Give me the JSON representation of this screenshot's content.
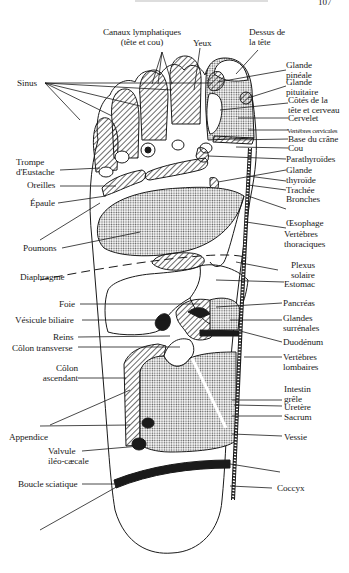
{
  "page": {
    "page_number": "107"
  },
  "diagram": {
    "colors": {
      "ink": "#1a1a1a",
      "paper": "#ffffff",
      "stipple": "#bdbdbd"
    },
    "labels_left": {
      "sinus": "Sinus",
      "trompe": "Trompe\nd'Eustache",
      "oreilles": "Oreilles",
      "epaule": "Épaule",
      "poumons": "Poumons",
      "diaphragme": "Diaphragme",
      "foie": "Foie",
      "vesicule": "Vésicule biliaire",
      "reins": "Reins",
      "colon_transverse": "Côlon transverse",
      "colon_ascendant": "Côlon\nascendant",
      "appendice": "Appendice",
      "valvule": "Valvule\niléo-cæcale",
      "boucle": "Boucle sciatique"
    },
    "labels_top": {
      "canaux": "Canaux lymphatiques\n(tête et cou)",
      "yeux": "Yeux",
      "dessus": "Dessus de\nla tête"
    },
    "labels_right": {
      "pineale": "Glande\npinéale",
      "pituitaire": "Glande\npituitaire",
      "cotes": "Côtés de la\ntête et cerveau",
      "cervelet": "Cervelet",
      "vertebres_cervicales": "Vertèbres cervicales",
      "base_crane": "Base du crâne",
      "cou": "Cou",
      "parathyroides": "Parathyroïdes",
      "thyroide": "Glande\nthyroïde",
      "trachee": "Trachée",
      "bronches": "Bronches",
      "oesophage": "Œsophage",
      "vertebres_thoraciques": "Vertèbres\nthoraciques",
      "plexus": "Plexus\nsolaire",
      "estomac": "Estomac",
      "pancreas": "Pancréas",
      "surrenales": "Glandes\nsurrénales",
      "duodenum": "Duodénum",
      "vertebres_lombaires": "Vertèbres\nlombaires",
      "intestin": "Intestin\ngrêle",
      "uretere": "Uretère",
      "sacrum": "Sacrum",
      "vessie": "Vessie",
      "coccyx": "Coccyx"
    }
  }
}
